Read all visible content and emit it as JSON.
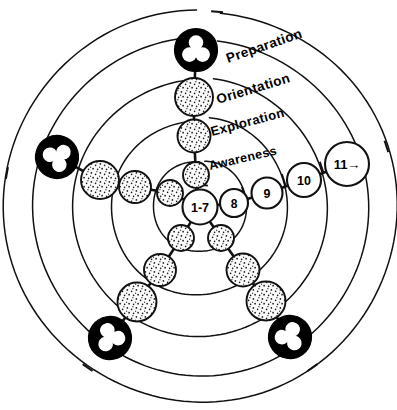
{
  "diagram": {
    "center": {
      "x": 200,
      "y": 207
    },
    "colors": {
      "stroke": "#111111",
      "fill_plain": "#ffffff",
      "fill_marker": "#000000",
      "background": "#ffffff",
      "stipple_dot": "#1a1a1a",
      "stipple_base": "#fbfbfb"
    },
    "rings": [
      {
        "name": "ring-1-awareness",
        "radius": 46
      },
      {
        "name": "ring-2-exploration",
        "radius": 88
      },
      {
        "name": "ring-3-orientation",
        "radius": 128
      },
      {
        "name": "ring-4-preparation",
        "radius": 168
      },
      {
        "name": "ring-5-outer",
        "radius": 196
      }
    ],
    "stage_labels": [
      {
        "id": "preparation",
        "text": "Preparation",
        "x": 228,
        "y": 63,
        "rotation": -19,
        "size": 13.5
      },
      {
        "id": "orientation",
        "text": "Orientation",
        "x": 218,
        "y": 104,
        "rotation": -17,
        "size": 13.5
      },
      {
        "id": "exploration",
        "text": "Exploration",
        "x": 212,
        "y": 136,
        "rotation": -15,
        "size": 13.0
      },
      {
        "id": "awareness",
        "text": "Awareness",
        "x": 210,
        "y": 170,
        "rotation": -13,
        "size": 12.5
      }
    ],
    "numbered_nodes": [
      {
        "id": "node-1-7",
        "label": "1-7",
        "cx": 200,
        "cy": 207,
        "r": 17.5,
        "font": 12.5
      },
      {
        "id": "node-8",
        "label": "8",
        "cx": 234,
        "cy": 203,
        "r": 14.0,
        "font": 12.0
      },
      {
        "id": "node-9",
        "label": "9",
        "cx": 267,
        "cy": 193,
        "r": 15.5,
        "font": 12.5
      },
      {
        "id": "node-10",
        "label": "10",
        "cx": 304,
        "cy": 180,
        "r": 17.0,
        "font": 12.5
      },
      {
        "id": "node-11",
        "label": "11→",
        "cx": 347,
        "cy": 164,
        "r": 22.0,
        "font": 13.0
      }
    ],
    "stipple_nodes": [
      {
        "id": "stipple-up-1",
        "cx": 196,
        "cy": 175,
        "r": 13.0
      },
      {
        "id": "stipple-up-2",
        "cx": 194,
        "cy": 136,
        "r": 16.5
      },
      {
        "id": "stipple-up-3",
        "cx": 194,
        "cy": 97,
        "r": 19.0
      },
      {
        "id": "stipple-ul-1",
        "cx": 170,
        "cy": 193,
        "r": 13.0
      },
      {
        "id": "stipple-ul-2",
        "cx": 135,
        "cy": 187,
        "r": 16.0
      },
      {
        "id": "stipple-ul-3",
        "cx": 100,
        "cy": 180,
        "r": 19.0
      },
      {
        "id": "stipple-ll-1",
        "cx": 181,
        "cy": 238,
        "r": 13.0
      },
      {
        "id": "stipple-ll-2",
        "cx": 160,
        "cy": 270,
        "r": 16.0
      },
      {
        "id": "stipple-ll-3",
        "cx": 137,
        "cy": 302,
        "r": 19.5
      },
      {
        "id": "stipple-lr-1",
        "cx": 221,
        "cy": 238,
        "r": 13.0
      },
      {
        "id": "stipple-lr-2",
        "cx": 243,
        "cy": 270,
        "r": 16.5
      },
      {
        "id": "stipple-lr-3",
        "cx": 266,
        "cy": 301,
        "r": 19.5
      }
    ],
    "trefoil_markers": [
      {
        "id": "trefoil-top",
        "cx": 196,
        "cy": 50,
        "r": 21.5,
        "rotation": 0
      },
      {
        "id": "trefoil-left",
        "cx": 57,
        "cy": 157,
        "r": 21.5,
        "rotation": -72
      },
      {
        "id": "trefoil-bottom-left",
        "cx": 110,
        "cy": 338,
        "r": 21.5,
        "rotation": -144
      },
      {
        "id": "trefoil-bottom-right",
        "cx": 290,
        "cy": 337,
        "r": 21.5,
        "rotation": 144
      }
    ],
    "spokes": [
      {
        "id": "spoke-up",
        "angle_deg": -85
      },
      {
        "id": "spoke-right",
        "angle_deg": -18
      },
      {
        "id": "spoke-lower-right",
        "angle_deg": 55
      },
      {
        "id": "spoke-lower-left",
        "angle_deg": 125
      },
      {
        "id": "spoke-upper-left",
        "angle_deg": 190
      }
    ]
  }
}
